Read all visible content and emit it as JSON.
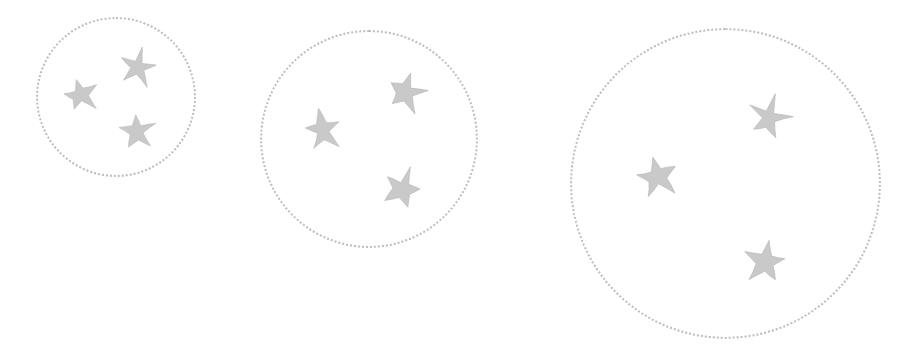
{
  "scene": {
    "title": "Three dotted circles each containing three stars",
    "width": 922,
    "height": 358,
    "background_color": "#ffffff",
    "star_fill_color": "#c9c9c9",
    "star_stroke_color": "#b5b5b5",
    "circle_dot_color": "#bdbdbd",
    "circle_count": 3,
    "stars_per_circle": 3,
    "total_stars": 9
  },
  "groups": [
    {
      "id": "group-1",
      "label": "small-circle-group",
      "size_rank": "small",
      "center_x": 116,
      "center_y": 97,
      "diameter": 160,
      "radius": 80,
      "dot_border_width": 2,
      "star_count": 3,
      "stars": [
        {
          "id": "g1-star-1",
          "label": "left-star",
          "cx": 80,
          "cy": 95,
          "size": 40,
          "rotation": -14
        },
        {
          "id": "g1-star-2",
          "label": "top-right-star",
          "cx": 138,
          "cy": 67,
          "size": 42,
          "rotation": 12
        },
        {
          "id": "g1-star-3",
          "label": "bottom-right-star",
          "cx": 137,
          "cy": 131,
          "size": 41,
          "rotation": -6
        }
      ]
    },
    {
      "id": "group-2",
      "label": "medium-circle-group",
      "size_rank": "medium",
      "center_x": 369,
      "center_y": 139,
      "diameter": 218,
      "radius": 109,
      "dot_border_width": 2,
      "star_count": 3,
      "stars": [
        {
          "id": "g2-star-1",
          "label": "left-star",
          "cx": 322,
          "cy": 130,
          "size": 45,
          "rotation": -10
        },
        {
          "id": "g2-star-2",
          "label": "top-right-star",
          "cx": 406,
          "cy": 92,
          "size": 46,
          "rotation": 14
        },
        {
          "id": "g2-star-3",
          "label": "bottom-right-star",
          "cx": 402,
          "cy": 188,
          "size": 45,
          "rotation": 20
        }
      ]
    },
    {
      "id": "group-3",
      "label": "large-circle-group",
      "size_rank": "large",
      "center_x": 725,
      "center_y": 183,
      "diameter": 311,
      "radius": 155,
      "dot_border_width": 2,
      "star_count": 3,
      "stars": [
        {
          "id": "g3-star-1",
          "label": "left-star",
          "cx": 657,
          "cy": 177,
          "size": 46,
          "rotation": -12
        },
        {
          "id": "g3-star-2",
          "label": "top-right-star",
          "cx": 768,
          "cy": 117,
          "size": 47,
          "rotation": 16
        },
        {
          "id": "g3-star-3",
          "label": "bottom-right-star",
          "cx": 766,
          "cy": 262,
          "size": 48,
          "rotation": 8
        }
      ]
    }
  ]
}
